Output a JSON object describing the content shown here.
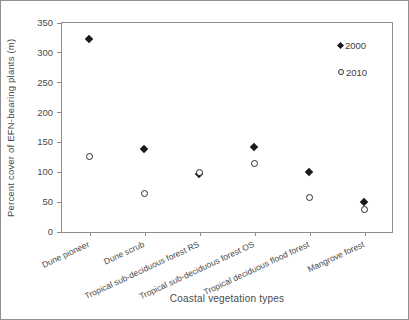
{
  "chart_data": {
    "type": "scatter",
    "title": "",
    "xlabel": "Coastal vegetation types",
    "ylabel": "Percent cover of EFN-bearing plants (m)",
    "categories": [
      "Dune pioneer",
      "Dune scrub",
      "Tropical sub-deciduous forest RS",
      "Tropical sub-deciduous forest OS",
      "Tropical deciduous flood forest",
      "Mangrove forest"
    ],
    "series": [
      {
        "name": "2000",
        "marker": "filled-diamond",
        "color": "#1a1a1a",
        "values": [
          322,
          138,
          97,
          141,
          100,
          50
        ]
      },
      {
        "name": "2010",
        "marker": "open-circle",
        "color": "#2b2b2b",
        "values": [
          127,
          65,
          100,
          115,
          57,
          38
        ]
      }
    ],
    "ylim": [
      0,
      350
    ],
    "yticks": [
      0,
      50,
      100,
      150,
      200,
      250,
      300,
      350
    ],
    "grid": false,
    "legend_position": "inside-top-right"
  }
}
